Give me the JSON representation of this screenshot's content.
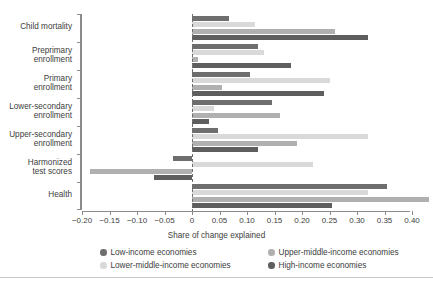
{
  "chart_data": {
    "type": "bar",
    "orientation": "horizontal",
    "title": "",
    "xlabel": "Share of change explained",
    "ylabel": "",
    "xlim": [
      -0.2,
      0.45
    ],
    "xticks": [
      -0.2,
      -0.15,
      -0.1,
      -0.05,
      0,
      0.05,
      0.1,
      0.15,
      0.2,
      0.25,
      0.3,
      0.35,
      0.4,
      0.45
    ],
    "xtick_labels": [
      "−0.20",
      "−0.15",
      "−0.10",
      "−0.05",
      "0",
      "0.05",
      "0.10",
      "0.15",
      "0.20",
      "0.25",
      "0.30",
      "0.35",
      "0.40",
      "0.45"
    ],
    "grid": false,
    "zero_reference_line": 0,
    "legend_position": "bottom",
    "categories": [
      "Child mortality",
      "Preprimary enrollment",
      "Primary enrollment",
      "Lower-secondary enrollment",
      "Upper-secondary enrollment",
      "Harmonized test scores",
      "Health"
    ],
    "category_labels": [
      [
        "Child mortality"
      ],
      [
        "Preprimary",
        "enrollment"
      ],
      [
        "Primary",
        "enrollment"
      ],
      [
        "Lower-secondary",
        "enrollment"
      ],
      [
        "Upper-secondary",
        "enrollment"
      ],
      [
        "Harmonized",
        "test scores"
      ],
      [
        "Health"
      ]
    ],
    "series": [
      {
        "name": "Low-income economies",
        "color": "#6e6e6e",
        "values": [
          0.068,
          0.12,
          0.106,
          0.145,
          0.048,
          -0.035,
          0.355
        ]
      },
      {
        "name": "Lower-middle-income economies",
        "color": "#d9d9d9",
        "values": [
          0.115,
          0.13,
          0.25,
          0.04,
          0.32,
          0.22,
          0.32
        ]
      },
      {
        "name": "Upper-middle-income economies",
        "color": "#b0b0b0",
        "values": [
          0.26,
          0.01,
          0.055,
          0.16,
          0.19,
          -0.185,
          0.43
        ]
      },
      {
        "name": "High-income economies",
        "color": "#5e5e5e",
        "values": [
          0.32,
          0.18,
          0.24,
          0.03,
          0.12,
          -0.07,
          0.255
        ]
      }
    ]
  },
  "legend": {
    "items": [
      {
        "label": "Low-income economies",
        "color": "#6e6e6e"
      },
      {
        "label": "Upper-middle-income economies",
        "color": "#b0b0b0"
      },
      {
        "label": "Lower-middle-income economies",
        "color": "#d9d9d9"
      },
      {
        "label": "High-income economies",
        "color": "#5e5e5e"
      }
    ]
  }
}
